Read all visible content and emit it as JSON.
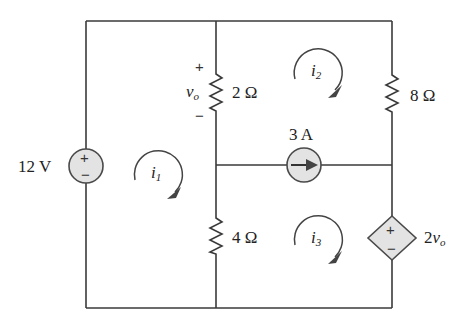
{
  "diagram": {
    "type": "circuit-schematic",
    "sources": {
      "voltage": {
        "value": "12 V",
        "plus": "+",
        "minus": "−"
      },
      "current": {
        "value": "3 A",
        "direction": "right"
      },
      "dependent": {
        "coeff": "2",
        "var": "v",
        "sub": "o",
        "plus": "+",
        "minus": "−"
      }
    },
    "resistors": [
      {
        "id": "r2",
        "label": "2 Ω"
      },
      {
        "id": "r8",
        "label": "8 Ω"
      },
      {
        "id": "r4",
        "label": "4 Ω"
      }
    ],
    "vo": {
      "var": "v",
      "sub": "o",
      "plus": "+",
      "minus": "−"
    },
    "meshes": [
      {
        "var": "i",
        "sub": "1",
        "direction": "clockwise"
      },
      {
        "var": "i",
        "sub": "2",
        "direction": "clockwise"
      },
      {
        "var": "i",
        "sub": "3",
        "direction": "clockwise"
      }
    ],
    "colors": {
      "wire": "#3a3a3a",
      "source_fill": "#e3e3e3"
    }
  }
}
